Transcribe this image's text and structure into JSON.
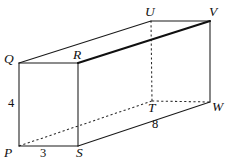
{
  "figure": {
    "kind": "rectangular-prism-diagram",
    "background_color": "#ffffff",
    "ink_color": "#111111",
    "width": 229,
    "height": 165,
    "vertices": [
      {
        "id": "P",
        "label": "P",
        "x": 19,
        "y": 146,
        "label_x": 4,
        "label_y": 146,
        "visible": true
      },
      {
        "id": "S",
        "label": "S",
        "x": 78,
        "y": 146,
        "label_x": 76,
        "label_y": 146,
        "visible": true
      },
      {
        "id": "R",
        "label": "R",
        "x": 78,
        "y": 63,
        "label_x": 73,
        "label_y": 48,
        "visible": true
      },
      {
        "id": "Q",
        "label": "Q",
        "x": 19,
        "y": 63,
        "label_x": 4,
        "label_y": 52,
        "visible": true
      },
      {
        "id": "T",
        "label": "T",
        "x": 152,
        "y": 101,
        "label_x": 148,
        "label_y": 102,
        "visible": true
      },
      {
        "id": "W",
        "label": "W",
        "x": 210,
        "y": 102,
        "label_x": 212,
        "label_y": 101,
        "visible": true
      },
      {
        "id": "V",
        "label": "V",
        "x": 210,
        "y": 21,
        "label_x": 209,
        "label_y": 6,
        "visible": true
      },
      {
        "id": "U",
        "label": "U",
        "x": 151,
        "y": 21,
        "label_x": 145,
        "label_y": 6,
        "visible": true
      }
    ],
    "edges": [
      {
        "from": "P",
        "to": "S",
        "style": "solid",
        "name": "edge-PS"
      },
      {
        "from": "S",
        "to": "R",
        "style": "solid",
        "name": "edge-SR"
      },
      {
        "from": "R",
        "to": "Q",
        "style": "solid",
        "name": "edge-RQ"
      },
      {
        "from": "Q",
        "to": "P",
        "style": "solid",
        "name": "edge-QP"
      },
      {
        "from": "Q",
        "to": "U",
        "style": "solid",
        "name": "edge-QU"
      },
      {
        "from": "U",
        "to": "V",
        "style": "solid",
        "name": "edge-UV"
      },
      {
        "from": "V",
        "to": "W",
        "style": "solid",
        "name": "edge-VW"
      },
      {
        "from": "S",
        "to": "W",
        "style": "solid",
        "name": "edge-SW"
      },
      {
        "from": "R",
        "to": "V",
        "style": "bold",
        "name": "edge-RV"
      },
      {
        "from": "P",
        "to": "T",
        "style": "hidden",
        "name": "edge-PT"
      },
      {
        "from": "T",
        "to": "W",
        "style": "hidden",
        "name": "edge-TW"
      },
      {
        "from": "T",
        "to": "U",
        "style": "hidden",
        "name": "edge-TU"
      }
    ],
    "dimensions": [
      {
        "id": "height",
        "value": "4",
        "x": 8,
        "y": 97,
        "edge": "QP"
      },
      {
        "id": "width",
        "value": "3",
        "x": 40,
        "y": 147,
        "edge": "PS"
      },
      {
        "id": "depth",
        "value": "8",
        "x": 152,
        "y": 119,
        "edge": "SW"
      }
    ]
  }
}
